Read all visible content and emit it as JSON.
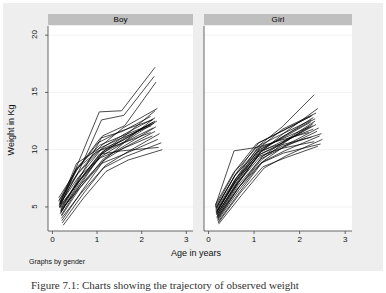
{
  "figure": {
    "caption": "Figure 7.1: Charts showing the trajectory of observed weight",
    "byline_note": "Graphs by gender",
    "background_color": "#eeeeee",
    "panel_header_color": "#bfbfbf",
    "line_color": "#000000",
    "grid_color": "#f2f2f2"
  },
  "chart_data": {
    "type": "line",
    "title": "",
    "subtitle": "",
    "xlabel": "Age in years",
    "ylabel": "Weight in Kg",
    "xlim": [
      -0.1,
      3.15
    ],
    "ylim": [
      2.9,
      20.8
    ],
    "xticks": [
      0,
      1,
      2,
      3
    ],
    "xtick_labels": [
      "0",
      "1",
      "2",
      "3"
    ],
    "yticks": [
      5,
      10,
      15,
      20
    ],
    "ytick_labels": [
      "5",
      "10",
      "15",
      "20"
    ],
    "grid": true,
    "grid_axis": "y",
    "legend": "none",
    "legend_position": "none",
    "annotations": [
      "Graphs by gender"
    ],
    "panel_variable": "gender",
    "panels": [
      {
        "label": "Boy",
        "series": [
          {
            "name": "id1",
            "x": [
              0.16,
              0.55,
              1.05,
              1.55,
              2.3
            ],
            "y": [
              4.9,
              8.6,
              13.3,
              13.4,
              17.2
            ]
          },
          {
            "name": "id2",
            "x": [
              0.17,
              0.6,
              1.1,
              1.6,
              2.28
            ],
            "y": [
              5.2,
              8.2,
              12.6,
              13.0,
              16.4
            ]
          },
          {
            "name": "id3",
            "x": [
              0.18,
              0.62,
              1.12,
              1.62,
              2.32
            ],
            "y": [
              4.6,
              7.6,
              11.2,
              12.1,
              15.9
            ]
          },
          {
            "name": "id4",
            "x": [
              0.15,
              0.58,
              1.08,
              1.58,
              2.35
            ],
            "y": [
              5.6,
              8.0,
              10.3,
              11.9,
              13.6
            ]
          },
          {
            "name": "id5",
            "x": [
              0.2,
              0.65,
              1.15,
              1.65,
              2.3
            ],
            "y": [
              4.3,
              7.1,
              9.9,
              11.3,
              13.4
            ]
          },
          {
            "name": "id6",
            "x": [
              0.16,
              0.57,
              1.07,
              1.57,
              2.2
            ],
            "y": [
              5.3,
              8.4,
              11.0,
              11.6,
              12.9
            ]
          },
          {
            "name": "id7",
            "x": [
              0.19,
              0.63,
              1.13,
              1.63,
              2.26
            ],
            "y": [
              4.8,
              7.8,
              10.2,
              11.4,
              12.7
            ]
          },
          {
            "name": "id8",
            "x": [
              0.14,
              0.52,
              1.02,
              1.52,
              2.24
            ],
            "y": [
              5.8,
              8.1,
              10.6,
              11.6,
              12.6
            ]
          },
          {
            "name": "id9",
            "x": [
              0.17,
              0.6,
              1.1,
              1.6,
              2.3
            ],
            "y": [
              4.4,
              7.0,
              9.6,
              11.0,
              12.5
            ]
          },
          {
            "name": "id10",
            "x": [
              0.21,
              0.66,
              1.16,
              1.66,
              2.34
            ],
            "y": [
              3.8,
              6.4,
              9.1,
              10.8,
              12.5
            ]
          },
          {
            "name": "id11",
            "x": [
              0.16,
              0.56,
              1.06,
              1.56,
              2.28
            ],
            "y": [
              5.4,
              8.5,
              10.4,
              11.2,
              12.3
            ]
          },
          {
            "name": "id12",
            "x": [
              0.18,
              0.61,
              1.11,
              1.61,
              2.18
            ],
            "y": [
              4.9,
              7.4,
              9.8,
              10.9,
              12.2
            ]
          },
          {
            "name": "id13",
            "x": [
              0.15,
              0.54,
              1.04,
              1.54,
              2.22
            ],
            "y": [
              5.1,
              8.8,
              10.1,
              11.0,
              12.1
            ]
          },
          {
            "name": "id14",
            "x": [
              0.2,
              0.64,
              1.14,
              1.64,
              2.32
            ],
            "y": [
              4.2,
              6.8,
              9.2,
              10.4,
              12.0
            ]
          },
          {
            "name": "id15",
            "x": [
              0.17,
              0.59,
              1.09,
              1.59,
              2.26
            ],
            "y": [
              5.0,
              7.2,
              9.4,
              10.6,
              11.9
            ]
          },
          {
            "name": "id16",
            "x": [
              0.19,
              0.62,
              1.12,
              1.62,
              2.3
            ],
            "y": [
              4.6,
              6.9,
              9.0,
              10.2,
              11.6
            ]
          },
          {
            "name": "id17",
            "x": [
              0.14,
              0.53,
              1.03,
              1.53,
              2.2
            ],
            "y": [
              5.5,
              8.3,
              9.9,
              10.5,
              11.5
            ]
          },
          {
            "name": "id18",
            "x": [
              0.22,
              0.68,
              1.18,
              1.68,
              2.4
            ],
            "y": [
              3.6,
              6.1,
              8.6,
              9.8,
              11.4
            ]
          },
          {
            "name": "id19",
            "x": [
              0.16,
              0.58,
              1.08,
              1.58,
              2.24
            ],
            "y": [
              5.2,
              7.6,
              9.3,
              10.1,
              11.2
            ]
          },
          {
            "name": "id20",
            "x": [
              0.18,
              0.6,
              1.1,
              1.6,
              2.36
            ],
            "y": [
              4.7,
              6.6,
              8.8,
              9.6,
              10.9
            ]
          },
          {
            "name": "id21",
            "x": [
              0.2,
              0.64,
              1.14,
              1.64,
              2.44
            ],
            "y": [
              4.0,
              6.2,
              8.4,
              9.4,
              10.6
            ]
          },
          {
            "name": "id22",
            "x": [
              0.15,
              0.55,
              1.05,
              1.55,
              2.38
            ],
            "y": [
              5.0,
              7.0,
              9.6,
              9.9,
              10.2
            ]
          },
          {
            "name": "id23",
            "x": [
              0.24,
              0.7,
              1.2,
              1.7,
              2.46
            ],
            "y": [
              3.4,
              5.8,
              8.1,
              9.1,
              10.0
            ]
          },
          {
            "name": "id24",
            "x": [
              0.17,
              0.57,
              1.07,
              1.57,
              2.26
            ],
            "y": [
              5.3,
              7.9,
              10.0,
              10.8,
              12.4
            ]
          },
          {
            "name": "id25",
            "x": [
              0.19,
              0.61,
              1.11,
              1.61,
              2.3
            ],
            "y": [
              4.5,
              7.3,
              9.7,
              10.7,
              12.8
            ]
          }
        ]
      },
      {
        "label": "Girl",
        "series": [
          {
            "name": "id26",
            "x": [
              0.17,
              0.62,
              1.12,
              1.62,
              2.32
            ],
            "y": [
              4.4,
              7.6,
              10.4,
              12.0,
              14.8
            ]
          },
          {
            "name": "id27",
            "x": [
              0.18,
              0.64,
              1.14,
              1.64,
              2.4
            ],
            "y": [
              4.1,
              7.0,
              9.8,
              11.4,
              13.6
            ]
          },
          {
            "name": "id28",
            "x": [
              0.16,
              0.6,
              1.1,
              1.6,
              2.28
            ],
            "y": [
              4.8,
              7.9,
              10.6,
              11.6,
              13.0
            ]
          },
          {
            "name": "id29",
            "x": [
              0.19,
              0.66,
              1.16,
              1.66,
              2.3
            ],
            "y": [
              4.2,
              7.2,
              9.9,
              11.2,
              12.8
            ]
          },
          {
            "name": "id30",
            "x": [
              0.15,
              0.58,
              1.08,
              1.58,
              2.26
            ],
            "y": [
              5.0,
              8.1,
              10.3,
              11.3,
              12.6
            ]
          },
          {
            "name": "id31",
            "x": [
              0.2,
              0.68,
              1.18,
              1.68,
              2.34
            ],
            "y": [
              3.9,
              6.8,
              9.4,
              10.8,
              12.5
            ]
          },
          {
            "name": "id32",
            "x": [
              0.17,
              0.61,
              1.11,
              1.61,
              2.24
            ],
            "y": [
              4.6,
              7.5,
              10.0,
              11.0,
              12.4
            ]
          },
          {
            "name": "id33",
            "x": [
              0.18,
              0.63,
              1.13,
              1.63,
              2.36
            ],
            "y": [
              4.3,
              7.1,
              9.6,
              10.6,
              12.2
            ]
          },
          {
            "name": "id34",
            "x": [
              0.16,
              0.59,
              1.09,
              1.59,
              2.22
            ],
            "y": [
              4.9,
              7.8,
              10.1,
              10.9,
              12.0
            ]
          },
          {
            "name": "id35",
            "x": [
              0.21,
              0.7,
              1.2,
              1.7,
              2.42
            ],
            "y": [
              3.7,
              6.4,
              9.0,
              10.4,
              11.9
            ]
          },
          {
            "name": "id36",
            "x": [
              0.17,
              0.6,
              1.1,
              1.6,
              2.3
            ],
            "y": [
              4.5,
              7.3,
              9.7,
              10.7,
              11.8
            ]
          },
          {
            "name": "id37",
            "x": [
              0.19,
              0.65,
              1.15,
              1.65,
              2.38
            ],
            "y": [
              4.0,
              6.9,
              9.2,
              10.2,
              11.6
            ]
          },
          {
            "name": "id38",
            "x": [
              0.15,
              0.56,
              1.06,
              1.56,
              2.2
            ],
            "y": [
              5.1,
              9.9,
              10.2,
              10.8,
              11.5
            ]
          },
          {
            "name": "id39",
            "x": [
              0.18,
              0.62,
              1.12,
              1.62,
              2.48
            ],
            "y": [
              4.4,
              7.0,
              9.3,
              10.3,
              11.4
            ]
          },
          {
            "name": "id40",
            "x": [
              0.2,
              0.67,
              1.17,
              1.67,
              2.44
            ],
            "y": [
              3.8,
              6.5,
              8.9,
              9.9,
              11.2
            ]
          },
          {
            "name": "id41",
            "x": [
              0.16,
              0.58,
              1.08,
              1.58,
              2.26
            ],
            "y": [
              4.7,
              7.4,
              9.5,
              10.4,
              11.1
            ]
          },
          {
            "name": "id42",
            "x": [
              0.22,
              0.72,
              1.22,
              1.72,
              2.5
            ],
            "y": [
              3.5,
              6.0,
              8.4,
              9.5,
              10.9
            ]
          },
          {
            "name": "id43",
            "x": [
              0.17,
              0.59,
              1.09,
              1.59,
              2.32
            ],
            "y": [
              4.6,
              7.2,
              9.4,
              10.1,
              10.7
            ]
          },
          {
            "name": "id44",
            "x": [
              0.19,
              0.64,
              1.14,
              1.64,
              2.46
            ],
            "y": [
              4.1,
              6.6,
              8.8,
              9.7,
              10.5
            ]
          },
          {
            "name": "id45",
            "x": [
              0.21,
              0.69,
              1.19,
              1.69,
              2.4
            ],
            "y": [
              3.6,
              6.2,
              8.5,
              9.3,
              10.3
            ]
          },
          {
            "name": "id46",
            "x": [
              0.16,
              0.57,
              1.07,
              1.57,
              2.28
            ],
            "y": [
              4.9,
              7.7,
              9.8,
              10.5,
              12.1
            ]
          },
          {
            "name": "id47",
            "x": [
              0.18,
              0.61,
              1.11,
              1.61,
              2.34
            ],
            "y": [
              4.3,
              7.1,
              9.9,
              11.1,
              12.7
            ]
          },
          {
            "name": "id48",
            "x": [
              0.2,
              0.66,
              1.16,
              1.66,
              2.3
            ],
            "y": [
              4.0,
              6.7,
              9.1,
              10.6,
              12.3
            ]
          },
          {
            "name": "id49",
            "x": [
              0.15,
              0.55,
              1.05,
              1.55,
              2.24
            ],
            "y": [
              5.2,
              8.0,
              10.5,
              11.5,
              12.9
            ]
          },
          {
            "name": "id50",
            "x": [
              0.17,
              0.63,
              1.13,
              1.63,
              2.36
            ],
            "y": [
              4.5,
              7.4,
              10.2,
              11.8,
              13.2
            ]
          }
        ]
      }
    ]
  },
  "axes": {
    "y_title": "Weight in Kg",
    "x_title": "Age in years"
  }
}
